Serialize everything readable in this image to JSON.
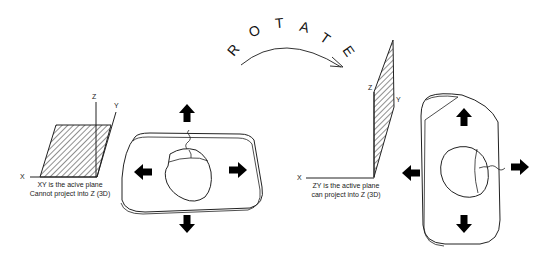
{
  "title_word": {
    "letters": [
      "R",
      "O",
      "T",
      "A",
      "T",
      "E"
    ],
    "text": "ROTATE"
  },
  "left_panel": {
    "axes": {
      "x": "X",
      "y": "Y",
      "z": "Z"
    },
    "caption_line1": "XY is the acive plane",
    "caption_line2": "Cannot project into Z (3D)"
  },
  "right_panel": {
    "axes": {
      "x": "X",
      "y": "Y",
      "z": "Z"
    },
    "caption_line1": "ZY is the active plane",
    "caption_line2": "can project into Z (3D)"
  },
  "colors": {
    "line": "#222222",
    "arrow_fill": "#000000",
    "background": "#ffffff"
  }
}
